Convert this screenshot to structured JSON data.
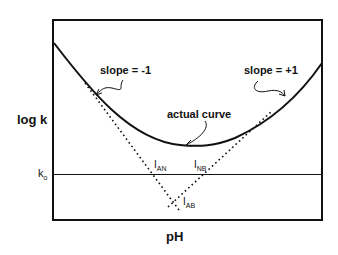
{
  "axes": {
    "ylabel": "log k",
    "xlabel": "pH",
    "reference_line_label_main": "k",
    "reference_line_label_sub": "o"
  },
  "annotations": {
    "left_slope": "slope = -1",
    "right_slope": "slope = +1",
    "curve": "actual curve"
  },
  "intersections": [
    {
      "main": "I",
      "sub": "AN"
    },
    {
      "main": "I",
      "sub": "NB"
    },
    {
      "main": "I",
      "sub": "AB"
    }
  ],
  "colors": {
    "line": "#111111",
    "background": "#ffffff"
  }
}
